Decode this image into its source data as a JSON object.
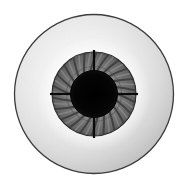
{
  "figure": {
    "title": "Eyeball anatomical illustration",
    "style": "grayscale line drawing",
    "background_color": "#ffffff",
    "canvas": {
      "width": 189,
      "height": 188
    }
  },
  "parts": {
    "sclera": {
      "label": "sclera",
      "center_x": 94,
      "center_y": 94,
      "radius": 80,
      "fill_light": "#f2f2f2",
      "fill_mid": "#e0e0e0",
      "fill_dark": "#c2c2c2",
      "outline_color": "#3a3a3a",
      "outline_width": 1.2
    },
    "limbus_glow": {
      "label": "limbal halo",
      "center_x": 94,
      "center_y": 94,
      "radius": 56,
      "color": "#fdfdfd"
    },
    "iris": {
      "label": "iris",
      "center_x": 94,
      "center_y": 94,
      "radius": 42,
      "fill": "#6e6e6e",
      "fill_inner": "#7d7d7d",
      "outline_color": "#2a2a2a",
      "outline_width": 1.0,
      "striae_count": 44,
      "striae_color": "#3d3d3d",
      "striae_light_color": "#8f8f8f"
    },
    "pupil": {
      "label": "pupil",
      "center_x": 94,
      "center_y": 94,
      "radius": 23.5,
      "fill": "#060606"
    },
    "cross_spokes": {
      "label": "radial axis markers",
      "color": "#0a0a0a",
      "width": 2.2,
      "angles_deg": [
        0,
        90,
        180,
        270
      ],
      "inner_radius": 22,
      "outer_radius": 44
    }
  },
  "colors": {
    "background": "#ffffff",
    "sclera_highlight": "#fafafa",
    "sclera_shadow": "#bdbdbd",
    "iris_gray": "#6e6e6e",
    "pupil_black": "#060606",
    "outline": "#3a3a3a"
  }
}
